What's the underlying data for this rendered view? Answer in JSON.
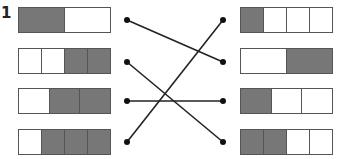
{
  "question": {
    "number": "1"
  },
  "colors": {
    "shaded": "#777777",
    "empty": "#ffffff",
    "line": "#222222"
  },
  "left_bars": [
    {
      "cells": [
        1,
        0
      ],
      "label": "1/2 shaded"
    },
    {
      "cells": [
        0,
        0,
        1,
        1
      ],
      "label": "2/4 shaded"
    },
    {
      "cells": [
        0,
        1,
        1
      ],
      "label": "2/3 shaded"
    },
    {
      "cells": [
        0,
        1,
        1,
        1
      ],
      "label": "3/4 shaded"
    }
  ],
  "right_bars": [
    {
      "cells": [
        1,
        0,
        0,
        0
      ],
      "label": "1/4 shaded"
    },
    {
      "cells": [
        0,
        1
      ],
      "label": "1/2 shaded"
    },
    {
      "cells": [
        1,
        0,
        0
      ],
      "label": "1/3 shaded"
    },
    {
      "cells": [
        1,
        1,
        0,
        0
      ],
      "label": "2/4 shaded"
    }
  ],
  "connections": [
    {
      "from_left": 0,
      "to_right": 1
    },
    {
      "from_left": 1,
      "to_right": 3
    },
    {
      "from_left": 2,
      "to_right": 2
    },
    {
      "from_left": 3,
      "to_right": 0
    }
  ]
}
